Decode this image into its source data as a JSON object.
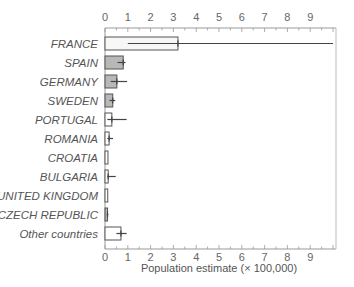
{
  "chart_data": {
    "type": "bar",
    "orientation": "horizontal",
    "title": "",
    "xlabel": "Population estimate (× 100,000)",
    "ylabel": "",
    "xlim": [
      0,
      10
    ],
    "xticks": [
      "0",
      "1",
      "2",
      "3",
      "4",
      "5",
      "6",
      "7",
      "8",
      "9"
    ],
    "grid": false,
    "categories": [
      "FRANCE",
      "SPAIN",
      "GERMANY",
      "SWEDEN",
      "PORTUGAL",
      "ROMANIA",
      "CROATIA",
      "BULGARIA",
      "UNITED KINGDOM",
      "CZECH REPUBLIC",
      "Other countries"
    ],
    "values": [
      3.2,
      0.8,
      0.52,
      0.34,
      0.3,
      0.18,
      0.13,
      0.14,
      0.12,
      0.11,
      0.7
    ],
    "error_low": [
      1.0,
      0.55,
      0.25,
      0.2,
      0.1,
      0.1,
      null,
      0.1,
      null,
      0.08,
      0.5
    ],
    "error_high": [
      10.0,
      0.9,
      0.97,
      0.45,
      0.95,
      0.35,
      null,
      0.47,
      null,
      0.15,
      0.95
    ],
    "fill": [
      "light",
      "gray",
      "gray",
      "gray",
      "white",
      "white",
      "white",
      "white",
      "white",
      "gray",
      "white"
    ],
    "colors": {
      "light": "#f7f7f7",
      "gray": "#b8b8b8",
      "white": "#ffffff",
      "stroke": "#555555",
      "axis": "#999999"
    }
  }
}
